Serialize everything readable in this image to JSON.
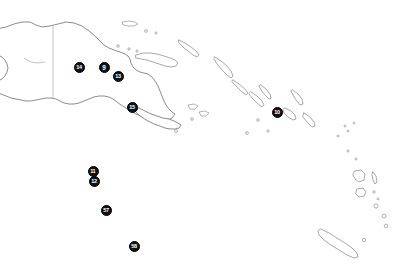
{
  "map": {
    "title": "Papua New Guinea, Solomon Islands and Vanuatu region map",
    "background_color": "#ffffff",
    "coastline_color": "#5a5a5a",
    "border_color": "#9a9a9a",
    "marker_fill_color": "#121212",
    "marker_text_color": "#ffffff",
    "width": 405,
    "height": 266,
    "markers": [
      {
        "id": "marker-14",
        "label": "14",
        "x": 79,
        "y": 67,
        "size": 11
      },
      {
        "id": "marker-9",
        "label": "9",
        "x": 104,
        "y": 67,
        "size": 11
      },
      {
        "id": "marker-13",
        "label": "13",
        "x": 118,
        "y": 76,
        "size": 11
      },
      {
        "id": "marker-15",
        "label": "15",
        "x": 132,
        "y": 107,
        "size": 11
      },
      {
        "id": "marker-10",
        "label": "10",
        "x": 277,
        "y": 112,
        "size": 11
      },
      {
        "id": "marker-11",
        "label": "11",
        "x": 93,
        "y": 171,
        "size": 11
      },
      {
        "id": "marker-12",
        "label": "12",
        "x": 94,
        "y": 181,
        "size": 11
      },
      {
        "id": "marker-57",
        "label": "57",
        "x": 106,
        "y": 210,
        "size": 11
      },
      {
        "id": "marker-58",
        "label": "58",
        "x": 134,
        "y": 246,
        "size": 11
      }
    ],
    "regions": [
      {
        "name": "new-guinea-mainland"
      },
      {
        "name": "new-britain"
      },
      {
        "name": "new-ireland"
      },
      {
        "name": "bougainville"
      },
      {
        "name": "solomon-islands-chain"
      },
      {
        "name": "vanuatu-chain"
      },
      {
        "name": "new-caledonia"
      }
    ]
  }
}
